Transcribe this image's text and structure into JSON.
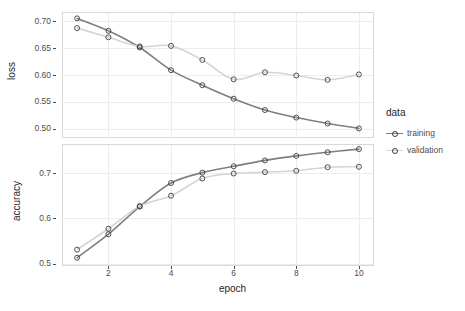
{
  "chart_data": {
    "type": "line",
    "title": "",
    "subtitle": "",
    "xlabel": "epoch",
    "ylabel": "",
    "facets": [
      {
        "id": "loss",
        "ylabel": "loss",
        "ylim": [
          0.485,
          0.715
        ],
        "yticks": [
          0.5,
          0.55,
          0.6,
          0.65,
          0.7
        ],
        "ytick_labels": [
          "0.50",
          "0.55",
          "0.60",
          "0.65",
          "0.70"
        ],
        "series": [
          {
            "name": "training",
            "color": "#7f7f7f",
            "x": [
              1,
              2,
              3,
              4,
              5,
              6,
              7,
              8,
              9,
              10
            ],
            "values": [
              0.705,
              0.682,
              0.651,
              0.609,
              0.581,
              0.556,
              0.535,
              0.521,
              0.51,
              0.501
            ]
          },
          {
            "name": "validation",
            "color": "#d4d4d4",
            "x": [
              1,
              2,
              3,
              4,
              5,
              6,
              7,
              8,
              9,
              10
            ],
            "values": [
              0.687,
              0.67,
              0.653,
              0.654,
              0.628,
              0.592,
              0.605,
              0.599,
              0.591,
              0.601
            ]
          }
        ]
      },
      {
        "id": "accuracy",
        "ylabel": "accuracy",
        "ylim": [
          0.497,
          0.762
        ],
        "yticks": [
          0.5,
          0.6,
          0.7
        ],
        "ytick_labels": [
          "0.5",
          "0.6",
          "0.7"
        ],
        "series": [
          {
            "name": "training",
            "color": "#7f7f7f",
            "x": [
              1,
              2,
              3,
              4,
              5,
              6,
              7,
              8,
              9,
              10
            ],
            "values": [
              0.513,
              0.565,
              0.626,
              0.678,
              0.701,
              0.715,
              0.728,
              0.738,
              0.746,
              0.753
            ]
          },
          {
            "name": "validation",
            "color": "#d4d4d4",
            "x": [
              1,
              2,
              3,
              4,
              5,
              6,
              7,
              8,
              9,
              10
            ],
            "values": [
              0.531,
              0.577,
              0.627,
              0.65,
              0.688,
              0.699,
              0.702,
              0.705,
              0.713,
              0.714
            ]
          }
        ]
      }
    ],
    "xlim": [
      0.55,
      10.45
    ],
    "xticks": [
      2,
      4,
      6,
      8,
      10
    ],
    "xtick_labels": [
      "2",
      "4",
      "6",
      "8",
      "10"
    ],
    "grid": true,
    "legend": {
      "position": "right",
      "title": "data",
      "entries": [
        {
          "label": "training",
          "color": "#7f7f7f"
        },
        {
          "label": "validation",
          "color": "#d4d4d4"
        }
      ]
    }
  },
  "legend": {
    "title": "data",
    "items": [
      {
        "label": "training"
      },
      {
        "label": "validation"
      }
    ]
  },
  "axes": {
    "x_title": "epoch",
    "loss_title": "loss",
    "accuracy_title": "accuracy"
  }
}
